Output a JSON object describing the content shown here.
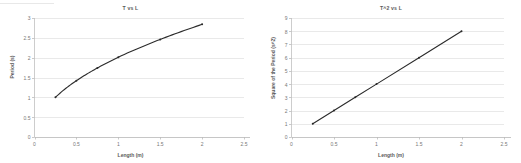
{
  "figure": {
    "background_color": "#ffffff",
    "text_color": "#6d6d6d",
    "series_color": "#2b2b2b",
    "gridline_color": "#e3e3e3",
    "axis_color": "#c9c9c9"
  },
  "charts": [
    {
      "id": "t-vs-l",
      "title": "T vs L",
      "xlabel": "Length (m)",
      "ylabel": "Period (s)",
      "x_ticks": [
        "0",
        "0.5",
        "1",
        "1.5",
        "2",
        "2.5"
      ],
      "y_ticks": [
        "0",
        "0.5",
        "1",
        "1.5",
        "2",
        "2.5",
        "3"
      ]
    },
    {
      "id": "t2-vs-l",
      "title": "T^2 vs L",
      "xlabel": "Length (m)",
      "ylabel": "Square of the Period (s^2)",
      "x_ticks": [
        "0",
        "0.5",
        "1",
        "1.5",
        "2",
        "2.5"
      ],
      "y_ticks": [
        "0",
        "1",
        "2",
        "3",
        "4",
        "5",
        "6",
        "7",
        "8",
        "9"
      ]
    }
  ],
  "chart_data": [
    {
      "type": "line",
      "id": "t-vs-l",
      "title": "T vs L",
      "xlabel": "Length (m)",
      "ylabel": "Period (s)",
      "xlim": [
        0,
        2.5
      ],
      "ylim": [
        0,
        3
      ],
      "xticks": [
        0,
        0.5,
        1,
        1.5,
        2,
        2.5
      ],
      "yticks": [
        0,
        0.5,
        1,
        1.5,
        2,
        2.5,
        3
      ],
      "grid": "horizontal",
      "legend": "none",
      "markers": true,
      "series": [
        {
          "name": "Period vs Length",
          "x": [
            0.25,
            0.5,
            0.75,
            1.0,
            1.5,
            2.0
          ],
          "y": [
            1.0,
            1.42,
            1.74,
            2.01,
            2.46,
            2.84
          ]
        }
      ]
    },
    {
      "type": "line",
      "id": "t2-vs-l",
      "title": "T^2 vs L",
      "xlabel": "Length (m)",
      "ylabel": "Square of the Period (s^2)",
      "xlim": [
        0,
        2.5
      ],
      "ylim": [
        0,
        9
      ],
      "xticks": [
        0,
        0.5,
        1,
        1.5,
        2,
        2.5
      ],
      "yticks": [
        0,
        1,
        2,
        3,
        4,
        5,
        6,
        7,
        8,
        9
      ],
      "grid": "horizontal",
      "legend": "none",
      "markers": true,
      "series": [
        {
          "name": "Square of Period vs Length",
          "x": [
            0.25,
            0.5,
            0.75,
            1.0,
            1.5,
            2.0
          ],
          "y": [
            1.0,
            2.0,
            3.0,
            4.0,
            6.0,
            8.0
          ]
        }
      ]
    }
  ]
}
